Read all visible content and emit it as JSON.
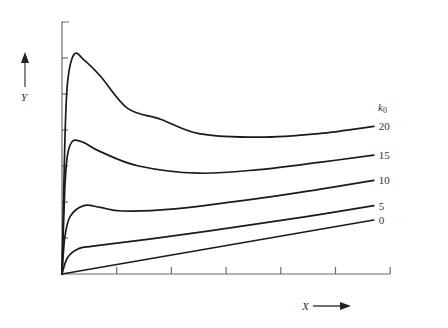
{
  "chart_data": {
    "type": "line",
    "title": "",
    "xlabel": "X",
    "ylabel": "Y",
    "legend_title": "k0",
    "legend_position": "right, at line ends",
    "grid": false,
    "x_ticks": 6,
    "y_ticks": 6,
    "xlim": [
      0,
      6
    ],
    "ylim": [
      0,
      7
    ],
    "tick_labels_shown": false,
    "series": [
      {
        "name": "20",
        "points": [
          [
            0,
            0
          ],
          [
            0.05,
            3.5
          ],
          [
            0.1,
            5.3
          ],
          [
            0.22,
            6.1
          ],
          [
            0.4,
            5.95
          ],
          [
            0.7,
            5.5
          ],
          [
            1.2,
            4.6
          ],
          [
            1.8,
            4.3
          ],
          [
            2.5,
            3.9
          ],
          [
            3.6,
            3.8
          ],
          [
            4.7,
            3.9
          ],
          [
            5.7,
            4.1
          ]
        ]
      },
      {
        "name": "15",
        "points": [
          [
            0,
            0
          ],
          [
            0.05,
            2.3
          ],
          [
            0.1,
            3.3
          ],
          [
            0.2,
            3.7
          ],
          [
            0.4,
            3.65
          ],
          [
            0.7,
            3.4
          ],
          [
            1.4,
            3.0
          ],
          [
            2.5,
            2.8
          ],
          [
            3.6,
            2.9
          ],
          [
            4.7,
            3.1
          ],
          [
            5.7,
            3.3
          ]
        ]
      },
      {
        "name": "10",
        "points": [
          [
            0,
            0
          ],
          [
            0.05,
            1.0
          ],
          [
            0.15,
            1.6
          ],
          [
            0.4,
            1.9
          ],
          [
            0.7,
            1.85
          ],
          [
            1.1,
            1.75
          ],
          [
            2.0,
            1.8
          ],
          [
            3.6,
            2.1
          ],
          [
            4.7,
            2.35
          ],
          [
            5.7,
            2.6
          ]
        ]
      },
      {
        "name": "5",
        "points": [
          [
            0,
            0
          ],
          [
            0.1,
            0.45
          ],
          [
            0.3,
            0.7
          ],
          [
            0.6,
            0.78
          ],
          [
            2.0,
            1.05
          ],
          [
            3.6,
            1.4
          ],
          [
            4.7,
            1.65
          ],
          [
            5.7,
            1.9
          ]
        ]
      },
      {
        "name": "0",
        "points": [
          [
            0,
            0
          ],
          [
            5.7,
            1.5
          ]
        ]
      }
    ]
  },
  "labels": {
    "y_axis": "Y",
    "x_axis": "X",
    "legend_title_main": "k",
    "legend_title_sub": "0",
    "series_labels": [
      "20",
      "15",
      "10",
      "5",
      "0"
    ]
  }
}
